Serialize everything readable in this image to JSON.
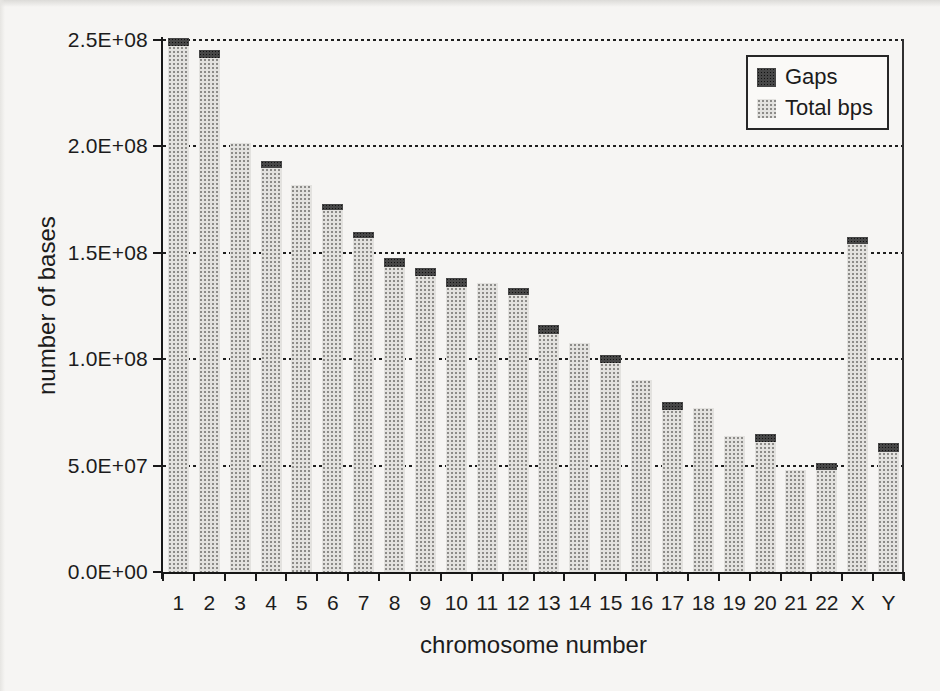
{
  "figure": {
    "background_color": "#f6f5f3",
    "ink_color": "#1c1c1c"
  },
  "colors": {
    "bar_total_bps": "#c9c8c5",
    "bar_gaps": "#3a3a3a",
    "gridline": "#1f1f1f",
    "legend_background": "#faf9f7"
  },
  "y_axis": {
    "title": "number of bases",
    "tick_labels": [
      "0.0E+00",
      "5.0E+07",
      "1.0E+08",
      "1.5E+08",
      "2.0E+08",
      "2.5E+08"
    ]
  },
  "x_axis": {
    "title": "chromosome number"
  },
  "legend": {
    "position": "top-right inside plot",
    "items": [
      {
        "label": "Gaps",
        "swatch": "dark"
      },
      {
        "label": "Total bps",
        "swatch": "light"
      }
    ]
  },
  "chart_data": {
    "type": "bar",
    "stacked": true,
    "title": "",
    "xlabel": "chromosome number",
    "ylabel": "number of bases",
    "ylim": [
      0,
      250000000
    ],
    "ytick_step": 50000000,
    "grid": "horizontal dotted",
    "legend_position": "top-right inside",
    "categories": [
      "1",
      "2",
      "3",
      "4",
      "5",
      "6",
      "7",
      "8",
      "9",
      "10",
      "11",
      "12",
      "13",
      "14",
      "15",
      "16",
      "17",
      "18",
      "19",
      "20",
      "21",
      "22",
      "X",
      "Y"
    ],
    "series": [
      {
        "name": "Total bps",
        "values": [
          247000000,
          241500000,
          201500000,
          190000000,
          182000000,
          170000000,
          157000000,
          143500000,
          139000000,
          134000000,
          136000000,
          130000000,
          112000000,
          107500000,
          98000000,
          90000000,
          76000000,
          77000000,
          64000000,
          61000000,
          48000000,
          48000000,
          154000000,
          56500000
        ]
      },
      {
        "name": "Gaps",
        "values": [
          4000000,
          4000000,
          0,
          3000000,
          0,
          3000000,
          3000000,
          4000000,
          4000000,
          4000000,
          0,
          3600000,
          4000000,
          0,
          4000000,
          0,
          4000000,
          0,
          0,
          3700000,
          0,
          3000000,
          3500000,
          4000000
        ]
      }
    ]
  }
}
